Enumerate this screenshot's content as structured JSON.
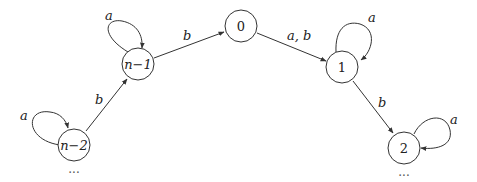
{
  "diagram": {
    "type": "state-transition-diagram",
    "nodes": [
      {
        "id": "n-2",
        "label": "n−2"
      },
      {
        "id": "n-1",
        "label": "n−1"
      },
      {
        "id": "0",
        "label": "0"
      },
      {
        "id": "1",
        "label": "1"
      },
      {
        "id": "2",
        "label": "2"
      }
    ],
    "edges": [
      {
        "from": "n-2",
        "to": "n-2",
        "label": "a"
      },
      {
        "from": "n-2",
        "to": "n-1",
        "label": "b"
      },
      {
        "from": "n-1",
        "to": "n-1",
        "label": "a"
      },
      {
        "from": "n-1",
        "to": "0",
        "label": "b"
      },
      {
        "from": "0",
        "to": "1",
        "label": "a, b"
      },
      {
        "from": "1",
        "to": "1",
        "label": "a"
      },
      {
        "from": "1",
        "to": "2",
        "label": "b"
      },
      {
        "from": "2",
        "to": "2",
        "label": "a"
      }
    ],
    "continuation_left": "···",
    "continuation_right": "···"
  }
}
